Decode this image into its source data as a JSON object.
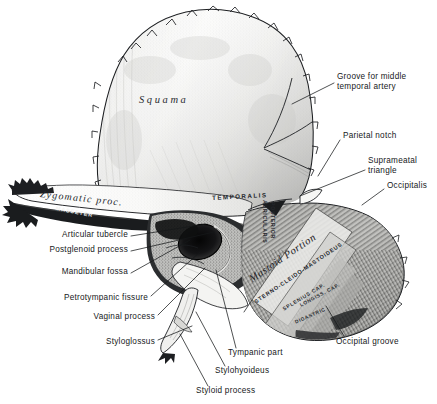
{
  "figure": {
    "background_color": "#ffffff",
    "ink_color": "#16181a",
    "width": 437,
    "height": 404
  },
  "callout_labels": [
    {
      "id": "groove-middle-temporal-artery",
      "text": "Groove for middle\ntemporal artery",
      "x": 337,
      "y": 77,
      "align": "left"
    },
    {
      "id": "parietal-notch",
      "text": "Parietal notch",
      "x": 343,
      "y": 135,
      "align": "left"
    },
    {
      "id": "suprameatal-triangle",
      "text": "Suprameatal\ntriangle",
      "x": 368,
      "y": 160,
      "align": "left"
    },
    {
      "id": "occipitalis",
      "text": "Occipitalis",
      "x": 387,
      "y": 185,
      "align": "left"
    },
    {
      "id": "articular-tubercle",
      "text": "Articular tubercle",
      "x": 128,
      "y": 234,
      "align": "right"
    },
    {
      "id": "postglenoid-process",
      "text": "Postglenoid process",
      "x": 128,
      "y": 249,
      "align": "right"
    },
    {
      "id": "mandibular-fossa",
      "text": "Mandibular fossa",
      "x": 128,
      "y": 271,
      "align": "right"
    },
    {
      "id": "petrotympanic-fissure",
      "text": "Petrotympanic fissure",
      "x": 148,
      "y": 297,
      "align": "right"
    },
    {
      "id": "vaginal-process",
      "text": "Vaginal process",
      "x": 155,
      "y": 316,
      "align": "right"
    },
    {
      "id": "styloglossus",
      "text": "Styloglossus",
      "x": 155,
      "y": 341,
      "align": "right"
    },
    {
      "id": "tympanic-part",
      "text": "Tympanic part",
      "x": 228,
      "y": 352,
      "align": "left"
    },
    {
      "id": "stylohyoideus",
      "text": "Stylohyoideus",
      "x": 215,
      "y": 370,
      "align": "left"
    },
    {
      "id": "styloid-process",
      "text": "Styloid process",
      "x": 196,
      "y": 390,
      "align": "left"
    },
    {
      "id": "occipital-groove",
      "text": "Occipital groove",
      "x": 336,
      "y": 341,
      "align": "left"
    }
  ],
  "intrinsic_labels": [
    {
      "id": "squama",
      "text": "Squama",
      "style": "italic-serif-spaced",
      "x": 139,
      "y": 101,
      "rotate": 0,
      "font_size": 10.5,
      "letter_spacing": 2.6
    },
    {
      "id": "zygomatic-process",
      "text": "Zygomatic proc.",
      "style": "italic-serif-spaced",
      "x": 40,
      "y": 196,
      "rotate": 6,
      "font_size": 10,
      "letter_spacing": 1.2
    },
    {
      "id": "mastoid-portion",
      "text": "Mastoid Portion",
      "style": "italic-serif-spaced",
      "x": 250,
      "y": 280,
      "rotate": -34,
      "font_size": 10.5,
      "letter_spacing": 0.6
    }
  ],
  "muscle_labels": [
    {
      "id": "temporalis",
      "text": "TEMPORALIS",
      "x": 212,
      "y": 198,
      "rotate": -3,
      "font_size": 6.2,
      "letter_spacing": 1.5,
      "color": "#24272c"
    },
    {
      "id": "masseter",
      "text": "MASSETER",
      "x": 56,
      "y": 209,
      "rotate": 11,
      "font_size": 5.4,
      "letter_spacing": 1.0,
      "color": "#f2f2f0"
    },
    {
      "id": "auricularis-posterior-line1",
      "text": "AURICULARIS",
      "x": 271,
      "y": 205,
      "rotate": 90,
      "font_size": 5.2,
      "letter_spacing": 0.7,
      "color": "#24272c"
    },
    {
      "id": "auricularis-posterior-line2",
      "text": "POSTERIOR",
      "x": 279,
      "y": 207,
      "rotate": 90,
      "font_size": 5.2,
      "letter_spacing": 0.7,
      "color": "#24272c"
    },
    {
      "id": "sterno-cleido-mastoideus",
      "text": "STERNO-CLEIDO-MASTOIDEUS",
      "x": 255,
      "y": 302,
      "rotate": -34,
      "font_size": 5.6,
      "letter_spacing": 0.8,
      "color": "#24272c"
    },
    {
      "id": "splenius-capitis",
      "text": "SPLENIUS CAP.",
      "x": 283,
      "y": 309,
      "rotate": -31,
      "font_size": 5.2,
      "letter_spacing": 0.7,
      "color": "#2a2d32"
    },
    {
      "id": "longissimus-capitis",
      "text": "LONGISS. CAP.",
      "x": 300,
      "y": 305,
      "rotate": -28,
      "font_size": 5.0,
      "letter_spacing": 0.6,
      "color": "#2a2d32"
    },
    {
      "id": "digastric",
      "text": "DIGASTRIC",
      "x": 295,
      "y": 322,
      "rotate": -24,
      "font_size": 5.0,
      "letter_spacing": 0.6,
      "color": "#2a2d32"
    }
  ],
  "anatomy_regions": [
    {
      "id": "squama-region",
      "name": "Squama (squamous part)"
    },
    {
      "id": "zygomatic-arch-region",
      "name": "Zygomatic process"
    },
    {
      "id": "mastoid-region",
      "name": "Mastoid portion"
    },
    {
      "id": "tympanic-region",
      "name": "Tympanic part"
    },
    {
      "id": "external-acoustic-meatus",
      "name": "External acoustic meatus"
    },
    {
      "id": "styloid-region",
      "name": "Styloid process"
    }
  ]
}
